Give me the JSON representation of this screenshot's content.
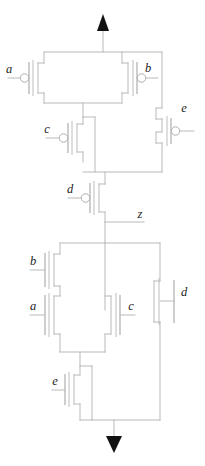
{
  "diagram": {
    "type": "cmos-transistor-schematic",
    "background_color": "#ffffff",
    "wire_color": "#b9b9b9",
    "label_color": "#1d1d1d",
    "power_rail": {
      "top_name": "vdd-arrow",
      "bottom_name": "gnd-arrow",
      "arrow_color": "#111111"
    },
    "output_node": {
      "label": "z"
    },
    "pull_up_network": {
      "device_type": "pmos",
      "transistors": [
        {
          "id": "p-a",
          "label": "a",
          "gate_side": "left",
          "bubble": true
        },
        {
          "id": "p-b",
          "label": "b",
          "gate_side": "right",
          "bubble": true
        },
        {
          "id": "p-e",
          "label": "e",
          "gate_side": "right",
          "bubble": true
        },
        {
          "id": "p-c",
          "label": "c",
          "gate_side": "left",
          "bubble": true
        },
        {
          "id": "p-d",
          "label": "d",
          "gate_side": "left",
          "bubble": true
        }
      ]
    },
    "pull_down_network": {
      "device_type": "nmos",
      "transistors": [
        {
          "id": "n-b",
          "label": "b",
          "gate_side": "left",
          "bubble": false
        },
        {
          "id": "n-a",
          "label": "a",
          "gate_side": "left",
          "bubble": false
        },
        {
          "id": "n-c",
          "label": "c",
          "gate_side": "right",
          "bubble": false
        },
        {
          "id": "n-d",
          "label": "d",
          "gate_side": "right",
          "bubble": false
        },
        {
          "id": "n-e",
          "label": "e",
          "gate_side": "left",
          "bubble": false
        }
      ]
    },
    "labels": {
      "pmos_a": "a",
      "pmos_b": "b",
      "pmos_e": "e",
      "pmos_c": "c",
      "pmos_d": "d",
      "output_z": "z",
      "nmos_b": "b",
      "nmos_a": "a",
      "nmos_c": "c",
      "nmos_d": "d",
      "nmos_e": "e"
    }
  }
}
